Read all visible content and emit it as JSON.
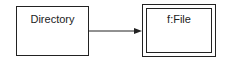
{
  "diagram": {
    "nodes": [
      {
        "id": "directory",
        "label": "Directory",
        "style": "single-border"
      },
      {
        "id": "file",
        "label": "f:File",
        "style": "double-border"
      }
    ],
    "edges": [
      {
        "from": "directory",
        "to": "file",
        "arrow": "filled"
      }
    ]
  }
}
